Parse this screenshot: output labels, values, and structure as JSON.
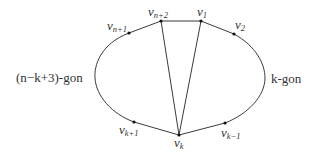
{
  "diagram": {
    "regions": {
      "left_label": "(n−k+3)-gon",
      "right_label": "k-gon"
    },
    "vertices": [
      {
        "id": "vn2",
        "base": "v",
        "sub": "n+2",
        "x": 161,
        "y": 21
      },
      {
        "id": "v1",
        "base": "v",
        "sub": "1",
        "x": 201,
        "y": 21
      },
      {
        "id": "vn1",
        "base": "v",
        "sub": "n+1",
        "x": 129,
        "y": 33
      },
      {
        "id": "v2",
        "base": "v",
        "sub": "2",
        "x": 234,
        "y": 34
      },
      {
        "id": "vk1",
        "base": "v",
        "sub": "k+1",
        "x": 134,
        "y": 122
      },
      {
        "id": "vkm1",
        "base": "v",
        "sub": "k−1",
        "x": 225,
        "y": 123
      },
      {
        "id": "vk",
        "base": "v",
        "sub": "k",
        "x": 179,
        "y": 135
      }
    ],
    "straight_edges": [
      [
        "vn1",
        "vn2"
      ],
      [
        "vn2",
        "v1"
      ],
      [
        "v1",
        "v2"
      ],
      [
        "vk1",
        "vk"
      ],
      [
        "vk",
        "vkm1"
      ],
      [
        "vn2",
        "vk"
      ],
      [
        "v1",
        "vk"
      ]
    ],
    "curved_edges": [
      [
        "vn1",
        "vk1",
        "left arc"
      ],
      [
        "v2",
        "vkm1",
        "right arc"
      ]
    ],
    "colors": {
      "line": "#3a3a3a",
      "text": "#333333",
      "background": "#ffffff"
    }
  }
}
